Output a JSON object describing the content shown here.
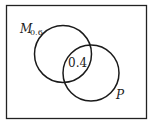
{
  "diagram": {
    "type": "venn",
    "sets": [
      {
        "name": "M",
        "label_main": "M",
        "label_sub": "0.6",
        "probability": 0.6
      },
      {
        "name": "P",
        "label_main": "P",
        "probability": null
      }
    ],
    "intersection": {
      "label": "0.4",
      "value": 0.4
    },
    "colors": {
      "stroke": "#1a1a1a",
      "background": "#ffffff"
    }
  }
}
